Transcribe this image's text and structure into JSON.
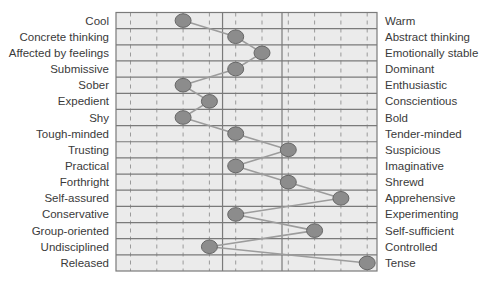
{
  "chart_data": {
    "type": "line",
    "title": "",
    "xlabel": "",
    "ylabel": "",
    "xlim": [
      1,
      10
    ],
    "scale_points": [
      1,
      2,
      3,
      4,
      5,
      6,
      7,
      8,
      9,
      10
    ],
    "major_dividers_between": [
      [
        4,
        5
      ],
      [
        6,
        7
      ]
    ],
    "grid": true,
    "legend": "none",
    "rows": [
      {
        "left": "Cool",
        "right": "Warm",
        "value": 3
      },
      {
        "left": "Concrete thinking",
        "right": "Abstract thinking",
        "value": 5
      },
      {
        "left": "Affected by feelings",
        "right": "Emotionally stable",
        "value": 6
      },
      {
        "left": "Submissive",
        "right": "Dominant",
        "value": 5
      },
      {
        "left": "Sober",
        "right": "Enthusiastic",
        "value": 3
      },
      {
        "left": "Expedient",
        "right": "Conscientious",
        "value": 4
      },
      {
        "left": "Shy",
        "right": "Bold",
        "value": 3
      },
      {
        "left": "Tough-minded",
        "right": "Tender-minded",
        "value": 5
      },
      {
        "left": "Trusting",
        "right": "Suspicious",
        "value": 7
      },
      {
        "left": "Practical",
        "right": "Imaginative",
        "value": 5
      },
      {
        "left": "Forthright",
        "right": "Shrewd",
        "value": 7
      },
      {
        "left": "Self-assured",
        "right": "Apprehensive",
        "value": 9
      },
      {
        "left": "Conservative",
        "right": "Experimenting",
        "value": 5
      },
      {
        "left": "Group-oriented",
        "right": "Self-sufficient",
        "value": 8
      },
      {
        "left": "Undisciplined",
        "right": "Controlled",
        "value": 4
      },
      {
        "left": "Released",
        "right": "Tense",
        "value": 10
      }
    ],
    "colors": {
      "cell_background": "#ebebeb",
      "grid_line": "#7a7a7a",
      "dash_tick": "#9a9a9a",
      "marker_fill": "#8c8c8c",
      "marker_stroke": "#666666",
      "connector": "#9c9c9c",
      "label_text": "#3a3a3a"
    }
  }
}
